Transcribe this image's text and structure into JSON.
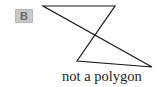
{
  "badge": {
    "label": "B",
    "background": "#c9c9c9",
    "color": "#6b6b6b"
  },
  "figure": {
    "stroke": "#1a1a1a",
    "vertices": [
      {
        "x": 43,
        "y": 6
      },
      {
        "x": 115,
        "y": 6
      },
      {
        "x": 77,
        "y": 61
      },
      {
        "x": 152,
        "y": 67
      }
    ],
    "points_attr": "43,6 115,6 77,61 152,67"
  },
  "caption": {
    "text": "not a polygon"
  }
}
